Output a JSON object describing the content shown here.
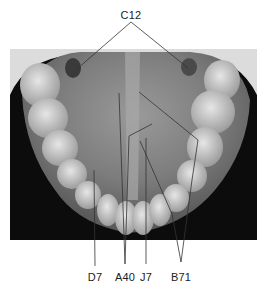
{
  "figure": {
    "type": "labeled radiograph",
    "labels": [
      {
        "id": "C12",
        "text": "C12",
        "x": 131,
        "y": 9
      },
      {
        "id": "D7",
        "text": "D7",
        "x": 95,
        "y": 271
      },
      {
        "id": "A40",
        "text": "A40",
        "x": 125,
        "y": 271
      },
      {
        "id": "J7",
        "text": "J7",
        "x": 146,
        "y": 271
      },
      {
        "id": "B71",
        "text": "B71",
        "x": 181,
        "y": 271
      }
    ],
    "colors": {
      "background": "#ffffff",
      "xray_dark": "#0c0c0c",
      "xray_mid": "#7a7a7a",
      "xray_light": "#d8d8d8",
      "leader_line": "#333333",
      "label_text": "#222222"
    }
  }
}
